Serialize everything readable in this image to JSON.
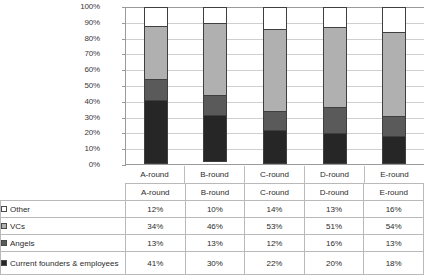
{
  "chart_data": {
    "type": "bar",
    "subtype": "stacked-100-percent",
    "title": "",
    "xlabel": "",
    "ylabel": "",
    "categories": [
      "A-round",
      "B-round",
      "C-round",
      "D-round",
      "E-round"
    ],
    "ylim": [
      0,
      100
    ],
    "ytick_labels": [
      "100%",
      "90%",
      "80%",
      "70%",
      "60%",
      "50%",
      "40%",
      "30%",
      "20%",
      "10%",
      "0%"
    ],
    "ytick_values": [
      100,
      90,
      80,
      70,
      60,
      50,
      40,
      30,
      20,
      10,
      0
    ],
    "grid": true,
    "legend_position": "table-first-column",
    "stack_order_top_to_bottom": [
      "Other",
      "VCs",
      "Angels",
      "Current founders & employees"
    ],
    "series": [
      {
        "name": "Other",
        "color": "#ffffff",
        "values": [
          12,
          10,
          14,
          13,
          16
        ],
        "value_labels": [
          "12%",
          "10%",
          "14%",
          "13%",
          "16%"
        ]
      },
      {
        "name": "VCs",
        "color": "#b0b0b0",
        "values": [
          34,
          46,
          53,
          51,
          54
        ],
        "value_labels": [
          "34%",
          "46%",
          "53%",
          "51%",
          "54%"
        ]
      },
      {
        "name": "Angels",
        "color": "#5a5a5a",
        "values": [
          13,
          13,
          12,
          16,
          13
        ],
        "value_labels": [
          "13%",
          "13%",
          "12%",
          "16%",
          "13%"
        ]
      },
      {
        "name": "Current founders & employees",
        "color": "#262626",
        "values": [
          41,
          30,
          22,
          20,
          18
        ],
        "value_labels": [
          "41%",
          "30%",
          "22%",
          "20%",
          "18%"
        ]
      }
    ]
  },
  "table": {
    "header": [
      "",
      "A-round",
      "B-round",
      "C-round",
      "D-round",
      "E-round"
    ],
    "rows": [
      {
        "label": "Other",
        "swatch": "#ffffff",
        "values": [
          "12%",
          "10%",
          "14%",
          "13%",
          "16%"
        ]
      },
      {
        "label": "VCs",
        "swatch": "#b0b0b0",
        "values": [
          "34%",
          "46%",
          "53%",
          "51%",
          "54%"
        ]
      },
      {
        "label": "Angels",
        "swatch": "#5a5a5a",
        "values": [
          "13%",
          "13%",
          "12%",
          "16%",
          "13%"
        ]
      },
      {
        "label": "Current founders & employees",
        "swatch": "#262626",
        "values": [
          "41%",
          "30%",
          "22%",
          "20%",
          "18%"
        ]
      }
    ]
  },
  "colors": {
    "other": "#ffffff",
    "vcs": "#b0b0b0",
    "angels": "#5a5a5a",
    "founders": "#262626",
    "gridline": "#cfcfcf",
    "axis": "#9a9a9a",
    "bar_outline": "#3f3f3f",
    "table_border": "#b9b9b9"
  }
}
